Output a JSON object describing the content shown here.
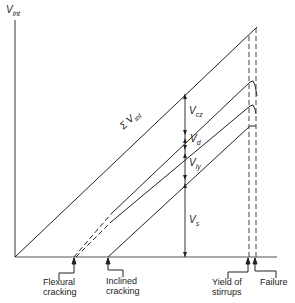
{
  "diagram": {
    "y_axis_label": "V",
    "y_axis_sub": "int",
    "sum_label": "Σ V",
    "sum_sub": "int",
    "components": [
      {
        "label": "V",
        "sub": "cz"
      },
      {
        "label": "V",
        "sub": "d"
      },
      {
        "label": "V",
        "sub": "iy"
      },
      {
        "label": "V",
        "sub": "s"
      }
    ],
    "events": [
      {
        "line1": "Flexural",
        "line2": "cracking"
      },
      {
        "line1": "Inclined",
        "line2": "cracking"
      },
      {
        "line1": "Yield of",
        "line2": "stirrups"
      },
      {
        "line1": "Failure",
        "line2": ""
      }
    ],
    "line_color": "#222222"
  }
}
